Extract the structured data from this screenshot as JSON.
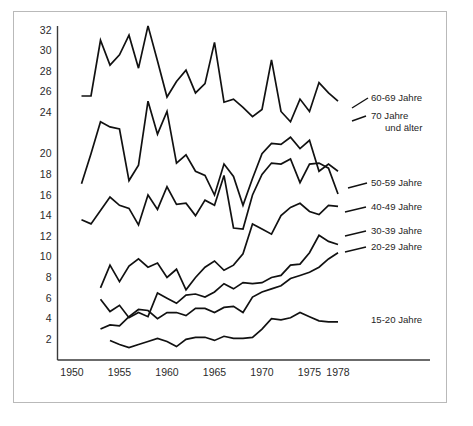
{
  "chart_data": {
    "type": "line",
    "title": "",
    "subtitle": "",
    "xlabel": "",
    "ylabel": "",
    "xlim": [
      1949,
      1980
    ],
    "ylim": [
      0,
      33
    ],
    "grid": false,
    "legend_position": "right-inline-labels",
    "x_ticks": [
      "1950",
      "1955",
      "1960",
      "1965",
      "1970",
      "1975",
      "1978"
    ],
    "x_tick_values": [
      1950,
      1955,
      1960,
      1965,
      1970,
      1975,
      1978
    ],
    "y_ticks": [
      "2",
      "4",
      "6",
      "8",
      "10",
      "12",
      "14",
      "16",
      "18",
      "20",
      "24",
      "26",
      "28",
      "30",
      "32"
    ],
    "y_tick_values": [
      2,
      4,
      6,
      8,
      10,
      12,
      14,
      16,
      18,
      20,
      22,
      24,
      26,
      28,
      30,
      32
    ],
    "y_tick_labels_rendered": [
      "2",
      "4",
      "6",
      "8",
      "10",
      "12",
      "14",
      "16",
      "18",
      "20",
      "",
      "24",
      "26",
      "28",
      "30",
      "32"
    ],
    "series": [
      {
        "name": "60-69 Jahre",
        "label": "60-69 Jahre",
        "x": [
          1951,
          1952,
          1953,
          1954,
          1955,
          1956,
          1957,
          1958,
          1959,
          1960,
          1961,
          1962,
          1963,
          1964,
          1965,
          1966,
          1967,
          1968,
          1969,
          1970,
          1971,
          1972,
          1973,
          1974,
          1975,
          1976,
          1977,
          1978
        ],
        "values": [
          25.6,
          25.6,
          31.0,
          28.6,
          29.6,
          31.5,
          28.3,
          32.4,
          29.0,
          25.5,
          27.0,
          28.1,
          25.9,
          26.8,
          30.8,
          25.0,
          25.3,
          24.5,
          23.6,
          24.3,
          29.1,
          24.1,
          23.1,
          25.3,
          24.1,
          26.9,
          25.9,
          25.1
        ]
      },
      {
        "name": "70 Jahre und älter",
        "label": "70 Jahre und älter",
        "x": [
          1951,
          1952,
          1953,
          1954,
          1955,
          1956,
          1957,
          1958,
          1959,
          1960,
          1961,
          1962,
          1963,
          1964,
          1965,
          1966,
          1967,
          1968,
          1969,
          1970,
          1971,
          1972,
          1973,
          1974,
          1975,
          1976,
          1977,
          1978
        ],
        "values": [
          17.1,
          20.0,
          23.1,
          22.6,
          22.4,
          17.4,
          18.9,
          25.1,
          21.9,
          24.1,
          19.1,
          19.9,
          18.3,
          17.9,
          16.0,
          19.0,
          17.8,
          15.0,
          17.6,
          20.0,
          21.0,
          20.9,
          21.6,
          20.5,
          21.3,
          18.3,
          19.0,
          18.3
        ]
      },
      {
        "name": "50-59 Jahre",
        "label": "50-59 Jahre",
        "x": [
          1951,
          1952,
          1953,
          1954,
          1955,
          1956,
          1957,
          1958,
          1959,
          1960,
          1961,
          1962,
          1963,
          1964,
          1965,
          1966,
          1967,
          1968,
          1969,
          1970,
          1971,
          1972,
          1973,
          1974,
          1975,
          1976,
          1977,
          1978
        ],
        "values": [
          13.6,
          13.2,
          14.5,
          15.8,
          15.0,
          14.7,
          13.1,
          16.0,
          14.6,
          16.8,
          15.1,
          15.2,
          14.0,
          15.5,
          15.0,
          17.9,
          12.8,
          12.7,
          16.0,
          18.0,
          19.1,
          19.0,
          19.5,
          17.2,
          19.0,
          19.1,
          18.6,
          16.1
        ]
      },
      {
        "name": "40-49 Jahre",
        "label": "40-49 Jahre",
        "x": [
          1953,
          1954,
          1955,
          1956,
          1957,
          1958,
          1959,
          1960,
          1961,
          1962,
          1963,
          1964,
          1965,
          1966,
          1967,
          1968,
          1969,
          1970,
          1971,
          1972,
          1973,
          1974,
          1975,
          1976,
          1977,
          1978
        ],
        "values": [
          7.0,
          9.2,
          7.6,
          9.1,
          9.8,
          9.0,
          9.4,
          8.0,
          8.8,
          6.8,
          8.0,
          9.0,
          9.6,
          8.7,
          9.2,
          10.3,
          13.2,
          12.7,
          12.2,
          14.0,
          14.8,
          15.2,
          14.4,
          14.1,
          15.0,
          14.9
        ]
      },
      {
        "name": "30-39 Jahre",
        "label": "30-39 Jahre",
        "x": [
          1953,
          1954,
          1955,
          1956,
          1957,
          1958,
          1959,
          1960,
          1961,
          1962,
          1963,
          1964,
          1965,
          1966,
          1967,
          1968,
          1969,
          1970,
          1971,
          1972,
          1973,
          1974,
          1975,
          1976,
          1977,
          1978
        ],
        "values": [
          5.9,
          4.7,
          5.3,
          4.1,
          4.6,
          4.2,
          6.5,
          6.0,
          5.5,
          6.3,
          6.4,
          6.1,
          6.6,
          7.4,
          6.9,
          7.5,
          7.4,
          7.5,
          8.0,
          8.2,
          9.2,
          9.3,
          10.4,
          12.1,
          11.5,
          11.2
        ]
      },
      {
        "name": "20-29 Jahre",
        "label": "20-29 Jahre",
        "x": [
          1953,
          1954,
          1955,
          1956,
          1957,
          1958,
          1959,
          1960,
          1961,
          1962,
          1963,
          1964,
          1965,
          1966,
          1967,
          1968,
          1969,
          1970,
          1971,
          1972,
          1973,
          1974,
          1975,
          1976,
          1977,
          1978
        ],
        "values": [
          3.0,
          3.4,
          3.3,
          4.2,
          4.9,
          4.8,
          4.0,
          4.6,
          4.6,
          4.3,
          5.0,
          5.0,
          4.6,
          5.1,
          5.2,
          4.6,
          6.1,
          6.6,
          6.9,
          7.2,
          7.9,
          8.2,
          8.5,
          9.0,
          9.8,
          10.4
        ]
      },
      {
        "name": "15-20 Jahre",
        "label": "15-20 Jahre",
        "x": [
          1954,
          1955,
          1956,
          1957,
          1958,
          1959,
          1960,
          1961,
          1962,
          1963,
          1964,
          1965,
          1966,
          1967,
          1968,
          1969,
          1970,
          1971,
          1972,
          1973,
          1974,
          1975,
          1976,
          1977,
          1978
        ],
        "values": [
          1.9,
          1.5,
          1.2,
          1.5,
          1.8,
          2.1,
          1.8,
          1.3,
          2.0,
          2.2,
          2.2,
          1.9,
          2.3,
          2.1,
          2.1,
          2.2,
          3.0,
          4.0,
          3.9,
          4.1,
          4.6,
          4.2,
          3.8,
          3.7,
          3.7
        ]
      }
    ],
    "series_labels": [
      {
        "text": "60-69 Jahre",
        "x": 371,
        "y": 101
      },
      {
        "text": "70  Jahre",
        "x": 371,
        "y": 119
      },
      {
        "text": "und älter",
        "x": 385,
        "y": 131
      },
      {
        "text": "50-59 Jahre",
        "x": 371,
        "y": 186
      },
      {
        "text": "40-49 Jahre",
        "x": 371,
        "y": 210
      },
      {
        "text": "30-39 Jahre",
        "x": 371,
        "y": 234
      },
      {
        "text": "20-29 Jahre",
        "x": 371,
        "y": 250
      },
      {
        "text": "15-20 Jahre",
        "x": 371,
        "y": 323
      }
    ]
  }
}
